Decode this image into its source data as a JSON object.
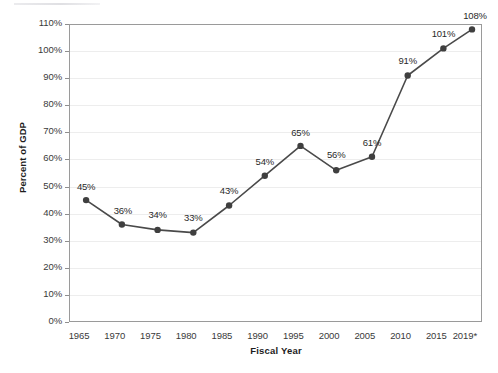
{
  "chart_data": {
    "type": "line",
    "title": "",
    "xlabel": "Fiscal Year",
    "ylabel": "Percent of GDP",
    "grid": true,
    "legend": "none",
    "ylim": [
      0,
      110
    ],
    "ytick_labels": [
      "110%",
      "100%",
      "90%",
      "80%",
      "70%",
      "60%",
      "50%",
      "40%",
      "30%",
      "20%",
      "10%",
      "0%"
    ],
    "ytick_values": [
      110,
      100,
      90,
      80,
      70,
      60,
      50,
      40,
      30,
      20,
      10,
      0
    ],
    "xtick_labels": [
      "1965",
      "1970",
      "1975",
      "1980",
      "1985",
      "1990",
      "1995",
      "2000",
      "2005",
      "2010",
      "2015",
      "2019*"
    ],
    "xtick_values": [
      1965,
      1970,
      1975,
      1980,
      1985,
      1990,
      1995,
      2000,
      2005,
      2010,
      2015,
      2019
    ],
    "series": [
      {
        "name": "Percent of GDP",
        "color": "#4a4a4a",
        "points": [
          {
            "x": 1966,
            "y": 45,
            "label": "45%"
          },
          {
            "x": 1971,
            "y": 36,
            "label": "36%"
          },
          {
            "x": 1976,
            "y": 34,
            "label": "34%"
          },
          {
            "x": 1981,
            "y": 33,
            "label": "33%"
          },
          {
            "x": 1986,
            "y": 43,
            "label": "43%"
          },
          {
            "x": 1991,
            "y": 54,
            "label": "54%"
          },
          {
            "x": 1996,
            "y": 65,
            "label": "65%"
          },
          {
            "x": 2001,
            "y": 56,
            "label": "56%"
          },
          {
            "x": 2006,
            "y": 61,
            "label": "61%"
          },
          {
            "x": 2011,
            "y": 91,
            "label": "91%"
          },
          {
            "x": 2016,
            "y": 101,
            "label": "101%"
          },
          {
            "x": 2020,
            "y": 108,
            "label": "108%"
          }
        ]
      }
    ]
  },
  "style": {
    "line_color": "#4a4a4a",
    "marker_color": "#3f3f3f",
    "grid_color": "#ededed",
    "axis_color": "#9a9a9a",
    "text_color": "#2a2a2a",
    "background": "#ffffff"
  }
}
